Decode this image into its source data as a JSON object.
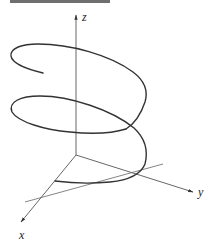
{
  "figure": {
    "type": "3d-helix-diagram",
    "axes": {
      "x_label": "x",
      "y_label": "y",
      "z_label": "z"
    },
    "colors": {
      "curve": "#333333",
      "axis": "#555555",
      "strip": "#6f6f6f"
    }
  }
}
